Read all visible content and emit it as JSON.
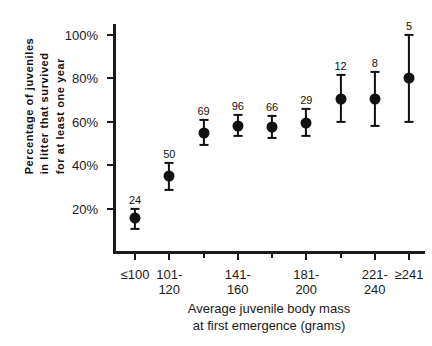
{
  "chart_data": {
    "type": "scatter",
    "title": "",
    "xlabel": "Average juvenile body mass at first emergence (grams)",
    "xlabel_lines": [
      "Average juvenile body mass",
      "at first emergence (grams)"
    ],
    "ylabel": "Percentage of juveniles in litter that survived for at least one year",
    "ylabel_lines": [
      "Percentage of juveniles",
      "in litter that survived",
      "for at least one year"
    ],
    "ylim": [
      0,
      105
    ],
    "ytick_values": [
      20,
      40,
      60,
      80,
      100
    ],
    "ytick_labels": [
      "20%",
      "40%",
      "60%",
      "80%",
      "100%"
    ],
    "grid": false,
    "legend": "none",
    "categories": [
      "≤100",
      "101-120",
      "121-140",
      "141-160",
      "161-180",
      "181-200",
      "201-220",
      "221-240",
      "≥241"
    ],
    "xtick_labels_visible": [
      {
        "index": 0,
        "lines": [
          "≤100"
        ]
      },
      {
        "index": 1,
        "lines": [
          "101-",
          "120"
        ]
      },
      {
        "index": 3,
        "lines": [
          "141-",
          "160"
        ]
      },
      {
        "index": 5,
        "lines": [
          "181-",
          "200"
        ]
      },
      {
        "index": 7,
        "lines": [
          "221-",
          "240"
        ]
      },
      {
        "index": 8,
        "lines": [
          "≥241"
        ]
      }
    ],
    "series": [
      {
        "name": "Percentage survived",
        "points": [
          {
            "category": "≤100",
            "value": 15.5,
            "low": 10.5,
            "high": 20.0,
            "n": 24
          },
          {
            "category": "101-120",
            "value": 35.0,
            "low": 28.5,
            "high": 41.0,
            "n": 50
          },
          {
            "category": "121-140",
            "value": 55.0,
            "low": 49.5,
            "high": 61.0,
            "n": 69
          },
          {
            "category": "141-160",
            "value": 58.0,
            "low": 53.5,
            "high": 63.0,
            "n": 96
          },
          {
            "category": "161-180",
            "value": 57.5,
            "low": 52.5,
            "high": 62.5,
            "n": 66
          },
          {
            "category": "181-200",
            "value": 59.5,
            "low": 53.5,
            "high": 66.0,
            "n": 29
          },
          {
            "category": "201-220",
            "value": 70.5,
            "low": 60.0,
            "high": 81.5,
            "n": 12
          },
          {
            "category": "221-240",
            "value": 70.5,
            "low": 58.0,
            "high": 83.0,
            "n": 8
          },
          {
            "category": "≥241",
            "value": 80.0,
            "low": 60.0,
            "high": 100.0,
            "n": 5
          }
        ]
      }
    ],
    "marker": {
      "shape": "circle",
      "color": "#111111",
      "size_px": 11
    },
    "errorbar": {
      "color": "#111111",
      "cap_width_px": 9
    },
    "n_label_note": "Number above each point is the sample size (number of litters)"
  },
  "colors": {
    "axis": "#1a1a1a",
    "marker": "#111111",
    "background": "#ffffff"
  }
}
